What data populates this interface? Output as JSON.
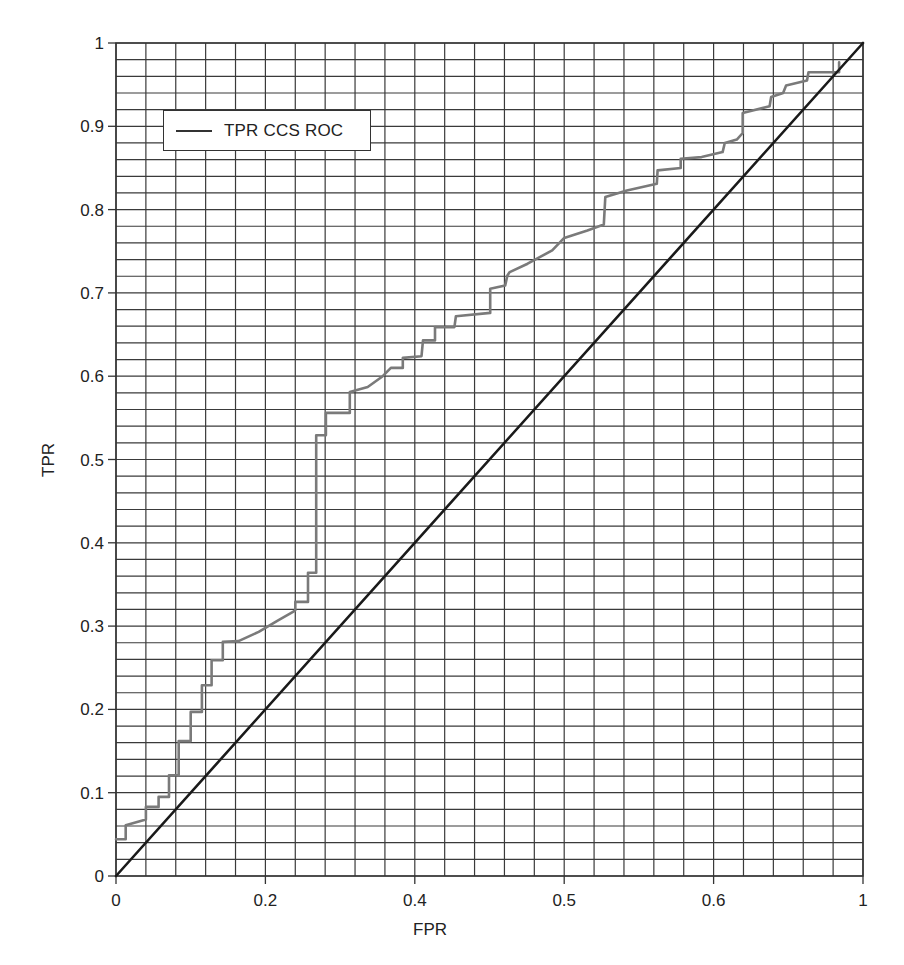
{
  "chart_data": {
    "type": "line",
    "title": "",
    "xlabel": "FPR",
    "ylabel": "TPR",
    "xlim": [
      0,
      1
    ],
    "ylim": [
      0,
      1
    ],
    "grid": true,
    "grid_x_divisions": 25,
    "grid_y_divisions": 50,
    "x_tick_labels": [
      "0",
      "0.2",
      "0.4",
      "0.5",
      "0.6",
      "1"
    ],
    "x_tick_positions": [
      0,
      0.2,
      0.4,
      0.6,
      0.8,
      1.0
    ],
    "y_tick_labels": [
      "0",
      "0.1",
      "0.2",
      "0.3",
      "0.4",
      "0.5",
      "0.6",
      "0.7",
      "0.8",
      "0.9",
      "1"
    ],
    "y_tick_positions": [
      0,
      0.1,
      0.2,
      0.3,
      0.4,
      0.5,
      0.6,
      0.7,
      0.8,
      0.9,
      1.0
    ],
    "legend": {
      "position": "upper-left",
      "entries": [
        "TPR CCS ROC"
      ]
    },
    "series": [
      {
        "name": "TPR CCS ROC",
        "color": "#7a7a7a",
        "style": "step",
        "x": [
          0,
          0.013,
          0.013,
          0.04,
          0.04,
          0.057,
          0.057,
          0.071,
          0.071,
          0.084,
          0.084,
          0.1,
          0.1,
          0.115,
          0.115,
          0.128,
          0.128,
          0.143,
          0.143,
          0.164,
          0.191,
          0.217,
          0.237,
          0.24,
          0.24,
          0.257,
          0.257,
          0.268,
          0.268,
          0.281,
          0.281,
          0.313,
          0.313,
          0.337,
          0.357,
          0.368,
          0.384,
          0.384,
          0.409,
          0.411,
          0.427,
          0.427,
          0.453,
          0.455,
          0.501,
          0.501,
          0.521,
          0.524,
          0.527,
          0.551,
          0.584,
          0.6,
          0.631,
          0.653,
          0.655,
          0.684,
          0.724,
          0.725,
          0.756,
          0.756,
          0.784,
          0.812,
          0.815,
          0.831,
          0.839,
          0.839,
          0.875,
          0.877,
          0.893,
          0.897,
          0.925,
          0.927,
          0.968,
          0.968
        ],
        "y": [
          0.044,
          0.044,
          0.061,
          0.068,
          0.083,
          0.083,
          0.095,
          0.095,
          0.121,
          0.121,
          0.162,
          0.162,
          0.197,
          0.197,
          0.229,
          0.229,
          0.259,
          0.259,
          0.281,
          0.282,
          0.293,
          0.307,
          0.317,
          0.319,
          0.329,
          0.329,
          0.364,
          0.364,
          0.529,
          0.529,
          0.556,
          0.556,
          0.581,
          0.587,
          0.6,
          0.61,
          0.61,
          0.622,
          0.624,
          0.643,
          0.643,
          0.659,
          0.659,
          0.672,
          0.676,
          0.705,
          0.709,
          0.721,
          0.725,
          0.735,
          0.751,
          0.766,
          0.775,
          0.782,
          0.815,
          0.823,
          0.831,
          0.847,
          0.85,
          0.861,
          0.863,
          0.869,
          0.88,
          0.884,
          0.892,
          0.916,
          0.924,
          0.935,
          0.94,
          0.949,
          0.955,
          0.965,
          0.965,
          0.977
        ]
      },
      {
        "name": "Random classifier (diagonal)",
        "color": "#1a1a1a",
        "style": "line",
        "x": [
          0,
          1
        ],
        "y": [
          0,
          1
        ]
      }
    ]
  },
  "legend": {
    "label": "TPR CCS ROC"
  },
  "axes": {
    "xlabel": "FPR",
    "ylabel": "TPR"
  }
}
